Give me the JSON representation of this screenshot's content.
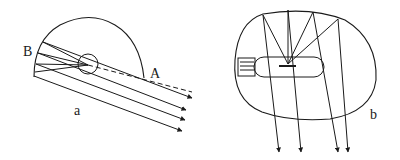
{
  "figure_a": {
    "labels": {
      "point_b": "B",
      "point_a": "A",
      "caption": "a"
    },
    "description": "Semicircular reflector with light source at focus emitting rays reflected into parallel beams"
  },
  "figure_b": {
    "labels": {
      "caption": "b"
    },
    "description": "Lamp bulb inside curved reflector with rays reflected downward as parallel beams"
  },
  "colors": {
    "stroke": "#1a1a1a",
    "background": "#ffffff"
  }
}
